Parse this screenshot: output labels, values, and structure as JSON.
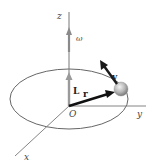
{
  "diagram": {
    "labels": {
      "z_axis": "z",
      "y_axis": "y",
      "x_axis": "x",
      "origin": "O",
      "omega": "ω",
      "angular_momentum": "L",
      "position": "r",
      "velocity": "v"
    },
    "colors": {
      "axis": "#666666",
      "ellipse": "#555555",
      "omega_arrow": "#8a8a8a",
      "L_arrow": "#9a9a9a",
      "r_arrow": "#111111",
      "v_arrow": "#1a1a1a",
      "sphere": "#b8b8b8"
    }
  }
}
